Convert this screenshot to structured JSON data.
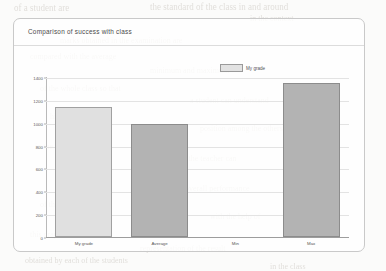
{
  "panel": {
    "title": "Comparison of success with class"
  },
  "legend": {
    "position": "top-right",
    "entries": [
      {
        "label": "My grade",
        "color": "#e0e0e0"
      }
    ]
  },
  "chart_data": {
    "type": "bar",
    "title": "Comparison of success with class",
    "xlabel": "",
    "ylabel": "",
    "categories": [
      "My grade",
      "Average",
      "Min",
      "Max"
    ],
    "values": [
      1140,
      990,
      0,
      1350
    ],
    "series": [
      {
        "name": "My grade",
        "values": [
          1140,
          990,
          0,
          1350
        ]
      }
    ],
    "bar_colors": [
      "#e0e0e0",
      "#b3b3b3",
      "#b3b3b3",
      "#b3b3b3"
    ],
    "ylim": [
      0,
      1400
    ],
    "yticks": [
      0,
      200,
      400,
      600,
      800,
      1000,
      1200,
      1400
    ],
    "ytick_labels": [
      "0",
      "200",
      "400",
      "600",
      "800",
      "1000",
      "1200",
      "1400"
    ],
    "grid": true,
    "grid_axis": "y",
    "legend": [
      "My grade"
    ],
    "legend_position": "top-right"
  },
  "scan_ghost_text": {
    "lines": [
      {
        "text": "the standard of the class in and around",
        "x": 150,
        "y": 2,
        "size": 9
      },
      {
        "text": "of a student are",
        "x": 14,
        "y": 3,
        "size": 9
      },
      {
        "text": "in the context",
        "x": 250,
        "y": 14,
        "size": 8
      },
      {
        "text": "marks obtained in the examination are",
        "x": 60,
        "y": 36,
        "size": 8
      },
      {
        "text": "compared with the average",
        "x": 30,
        "y": 52,
        "size": 8
      },
      {
        "text": "minimum and maximum",
        "x": 150,
        "y": 66,
        "size": 8
      },
      {
        "text": "of the whole class so that",
        "x": 40,
        "y": 84,
        "size": 8
      },
      {
        "text": "a student can understand",
        "x": 190,
        "y": 96,
        "size": 8
      },
      {
        "text": "his or her relative",
        "x": 50,
        "y": 112,
        "size": 8
      },
      {
        "text": "position among the others",
        "x": 200,
        "y": 124,
        "size": 8
      },
      {
        "text": "in the same class",
        "x": 35,
        "y": 142,
        "size": 8
      },
      {
        "text": "and the teacher can",
        "x": 175,
        "y": 154,
        "size": 8
      },
      {
        "text": "also evaluate the",
        "x": 55,
        "y": 172,
        "size": 8
      },
      {
        "text": "overall performance",
        "x": 185,
        "y": 184,
        "size": 8
      },
      {
        "text": "of the class as a whole",
        "x": 40,
        "y": 200,
        "size": 8
      },
      {
        "text": "with the help of",
        "x": 210,
        "y": 212,
        "size": 8
      },
      {
        "text": "this graphical",
        "x": 30,
        "y": 230,
        "size": 8
      },
      {
        "text": "representation of the result",
        "x": 140,
        "y": 244,
        "size": 8
      },
      {
        "text": "obtained by each of the students",
        "x": 25,
        "y": 256,
        "size": 8
      },
      {
        "text": "in the class",
        "x": 270,
        "y": 262,
        "size": 8
      }
    ]
  }
}
